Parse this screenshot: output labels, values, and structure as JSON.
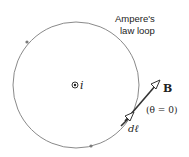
{
  "diagram": {
    "loop_label_line1": "Ampere's",
    "loop_label_line2": "law loop",
    "current_label": "i",
    "field_label": "B",
    "angle_label": "(θ = 0)",
    "element_label": "dℓ",
    "colors": {
      "loop": "#8a8a8a",
      "arrow": "#333333",
      "text": "#222222"
    }
  }
}
